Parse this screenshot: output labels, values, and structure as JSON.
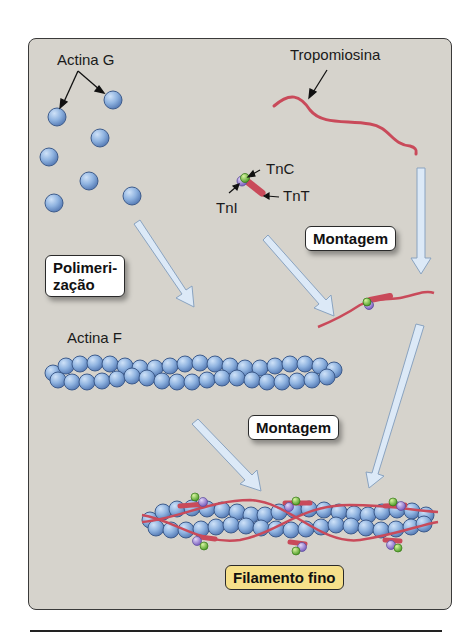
{
  "diagram": {
    "labels": {
      "actin_g": "Actina G",
      "tropomyosin": "Tropomiosina",
      "tnc": "TnC",
      "tnt": "TnT",
      "tni": "TnI",
      "actin_f": "Actina F"
    },
    "steps": {
      "polymerization_line1": "Polimeri-",
      "polymerization_line2": "zação",
      "assembly_1": "Montagem",
      "assembly_2": "Montagem"
    },
    "result": "Filamento fino",
    "colors": {
      "panel_bg": "#d6d3cc",
      "actin": "#8fb3e0",
      "tropomyosin": "#c94a5a",
      "tnc": "#7ac943",
      "tni": "#9a7fd0",
      "arrow": "#dce9f7",
      "result_box": "#f6e08a"
    }
  }
}
